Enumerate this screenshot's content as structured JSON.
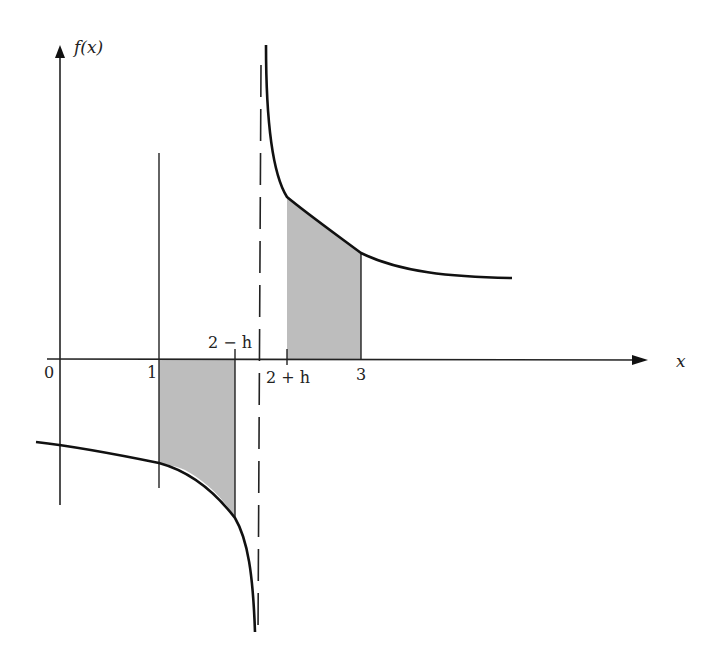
{
  "figure": {
    "y_axis_label": "f(x)",
    "x_axis_label": "x",
    "tick_labels": {
      "zero": "0",
      "one": "1",
      "two_minus_h": "2 − h",
      "two_plus_h": "2 + h",
      "three": "3"
    },
    "asymptote": {
      "x": 2,
      "style": "dashed"
    },
    "shaded_regions": [
      {
        "from": "1",
        "to": "2 − h",
        "side": "below x-axis"
      },
      {
        "from": "2 + h",
        "to": "3",
        "side": "above x-axis"
      }
    ],
    "colors": {
      "curve": "#111111",
      "axes": "#222222",
      "shade": "#bdbdbd",
      "background": "#ffffff"
    }
  }
}
